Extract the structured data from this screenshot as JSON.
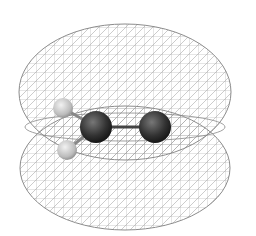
{
  "figure": {
    "molecule": {
      "atoms": [
        {
          "element": "H",
          "cx": 63,
          "cy": 108,
          "r": 10,
          "color": "#c9c9c9"
        },
        {
          "element": "H",
          "cx": 67,
          "cy": 150,
          "r": 10,
          "color": "#c9c9c9"
        },
        {
          "element": "C",
          "cx": 96,
          "cy": 127,
          "r": 16,
          "color": "#3a3a3a"
        },
        {
          "element": "O",
          "cx": 155,
          "cy": 127,
          "r": 16,
          "color": "#3a3a3a"
        }
      ]
    },
    "lobes": [
      {
        "name": "upper-lobe",
        "cx": 125,
        "cy": 92,
        "rx": 105,
        "ry": 68
      },
      {
        "name": "lower-lobe",
        "cx": 125,
        "cy": 166,
        "rx": 105,
        "ry": 64
      }
    ],
    "mesh_color": "#8a8a8a",
    "background": "#ffffff"
  }
}
